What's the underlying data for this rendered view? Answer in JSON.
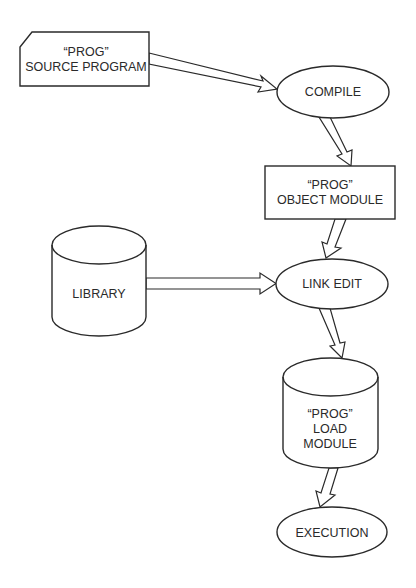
{
  "diagram": {
    "type": "flowchart",
    "nodes": {
      "source": {
        "shape": "punched-card",
        "line1": "“PROG”",
        "line2": "SOURCE PROGRAM"
      },
      "compile": {
        "shape": "ellipse",
        "label": "COMPILE"
      },
      "object": {
        "shape": "rectangle",
        "line1": "“PROG”",
        "line2": "OBJECT MODULE"
      },
      "library": {
        "shape": "cylinder",
        "label": "LIBRARY"
      },
      "link": {
        "shape": "ellipse",
        "label": "LINK EDIT"
      },
      "load": {
        "shape": "cylinder",
        "line1": "“PROG”",
        "line2": "LOAD",
        "line3": "MODULE"
      },
      "execution": {
        "shape": "ellipse",
        "label": "EXECUTION"
      }
    },
    "edges": [
      {
        "from": "source",
        "to": "compile"
      },
      {
        "from": "compile",
        "to": "object"
      },
      {
        "from": "object",
        "to": "link"
      },
      {
        "from": "library",
        "to": "link"
      },
      {
        "from": "link",
        "to": "load"
      },
      {
        "from": "load",
        "to": "execution"
      }
    ],
    "colors": {
      "stroke": "#2a2a2a",
      "fill": "#ffffff",
      "background": "#ffffff"
    }
  }
}
